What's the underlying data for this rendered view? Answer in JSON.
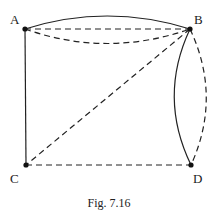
{
  "figure": {
    "caption": "Fig. 7.16",
    "vertices": [
      {
        "label": "A",
        "x": 25,
        "y": 29
      },
      {
        "label": "B",
        "x": 190,
        "y": 29
      },
      {
        "label": "C",
        "x": 26,
        "y": 165
      },
      {
        "label": "D",
        "x": 191,
        "y": 165
      }
    ],
    "edges": [
      {
        "from": "A",
        "to": "B",
        "style": "solid",
        "shape": "arc-above"
      },
      {
        "from": "A",
        "to": "B",
        "style": "dashed",
        "shape": "straight"
      },
      {
        "from": "A",
        "to": "B",
        "style": "dashed",
        "shape": "arc-below"
      },
      {
        "from": "A",
        "to": "C",
        "style": "solid",
        "shape": "straight"
      },
      {
        "from": "B",
        "to": "C",
        "style": "dashed",
        "shape": "straight"
      },
      {
        "from": "C",
        "to": "D",
        "style": "dashed",
        "shape": "straight"
      },
      {
        "from": "B",
        "to": "D",
        "style": "solid",
        "shape": "arc-left"
      },
      {
        "from": "B",
        "to": "D",
        "style": "dashed",
        "shape": "arc-right"
      }
    ]
  }
}
